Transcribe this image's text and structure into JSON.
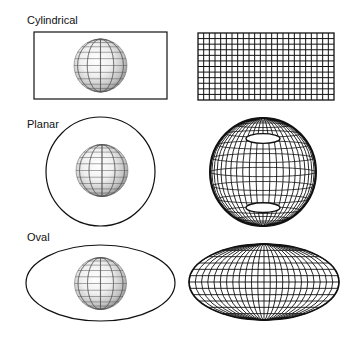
{
  "sections": [
    {
      "id": "cylindrical",
      "label": "Cylindrical",
      "label_pos": [
        27,
        15
      ],
      "surface": {
        "shape": "rect",
        "x": 34,
        "y": 32,
        "w": 133,
        "h": 67
      },
      "globe": {
        "cx": 100.5,
        "cy": 65.5,
        "r": 26.5
      },
      "projection": {
        "shape": "rect",
        "x": 198,
        "y": 33,
        "w": 136,
        "h": 67,
        "cols": 24,
        "rows": 12
      }
    },
    {
      "id": "planar",
      "label": "Planar",
      "label_pos": [
        27,
        119
      ],
      "surface": {
        "shape": "circle",
        "cx": 100.5,
        "cy": 171.5,
        "r": 54.5
      },
      "globe": {
        "cx": 102,
        "cy": 170.5,
        "r": 26
      },
      "projection": {
        "shape": "globe",
        "cx": 263,
        "cy": 172,
        "rx": 53,
        "ry": 54,
        "meridians": 24,
        "parallels": 12
      }
    },
    {
      "id": "oval",
      "label": "Oval",
      "label_pos": [
        27,
        232
      ],
      "surface": {
        "shape": "ellipse",
        "cx": 100.5,
        "cy": 283,
        "rx": 74.5,
        "ry": 38
      },
      "globe": {
        "cx": 100.5,
        "cy": 283.5,
        "r": 26
      },
      "projection": {
        "shape": "ellipse",
        "cx": 264,
        "cy": 282,
        "rx": 75,
        "ry": 38,
        "meridians": 24,
        "parallels": 12
      }
    }
  ],
  "colors": {
    "line": "#111111",
    "globe_line": "#555555",
    "globe_light": "#ffffff",
    "globe_dark": "#8a8a8a"
  }
}
